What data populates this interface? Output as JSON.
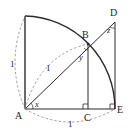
{
  "diagram": {
    "type": "geometry",
    "points": {
      "A": {
        "label": "A"
      },
      "B": {
        "label": "B"
      },
      "C": {
        "label": "C"
      },
      "D": {
        "label": "D"
      },
      "E": {
        "label": "E"
      }
    },
    "angles": {
      "x": {
        "label": "x",
        "vertex": "A"
      },
      "y": {
        "label": "y",
        "vertex": "B"
      },
      "z": {
        "label": "z",
        "vertex": "D"
      }
    },
    "lengths": {
      "AB": "1",
      "AE": "1",
      "radius_vertical": "1"
    },
    "right_angles": [
      "C",
      "E"
    ],
    "colors": {
      "stroke": "#2a2a2a",
      "dashed": "#888888"
    }
  }
}
